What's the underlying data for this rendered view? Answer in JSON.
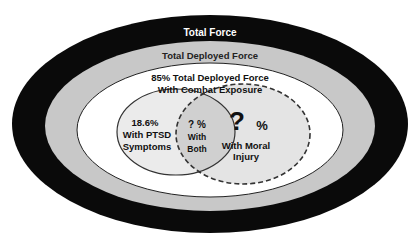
{
  "diagram": {
    "type": "nested-venn",
    "colors": {
      "total_force": "#0a0a0a",
      "deployed_force": "#c8c8c8",
      "combat_exposure": "#ffffff",
      "ptsd": "#ebebeb",
      "moral_injury": "#e4e4e4",
      "overlap": "#d0d0d0",
      "text_light": "#ffffff",
      "text_dark": "#111111"
    },
    "total_force": {
      "label": "Total Force"
    },
    "deployed_force": {
      "label": "Total Deployed  Force"
    },
    "combat_exposure": {
      "line1": "85% Total Deployed Force",
      "line2": "With Combat Exposure"
    },
    "ptsd": {
      "value": "18.6%",
      "line1": "With PTSD",
      "line2": "Symptoms"
    },
    "both": {
      "value": "? %",
      "line1": "With",
      "line2": "Both"
    },
    "moral_injury": {
      "question": "?",
      "percent": "%",
      "line1": "With Moral",
      "line2": "Injury"
    }
  }
}
